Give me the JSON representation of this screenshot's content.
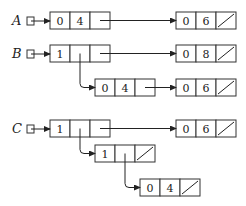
{
  "diagram": {
    "type": "linked-list-structures",
    "variables": [
      {
        "name": "A",
        "y": 21
      },
      {
        "name": "B",
        "y": 54
      },
      {
        "name": "C",
        "y": 129
      }
    ],
    "nodes": [
      {
        "id": "A1",
        "x": 50,
        "y": 12,
        "cells": [
          "0",
          "4",
          ""
        ],
        "nil": false
      },
      {
        "id": "A2",
        "x": 176,
        "y": 12,
        "cells": [
          "0",
          "6",
          ""
        ],
        "nil": true
      },
      {
        "id": "B1",
        "x": 50,
        "y": 45,
        "cells": [
          "1",
          "",
          ""
        ],
        "nil": false
      },
      {
        "id": "B2",
        "x": 176,
        "y": 45,
        "cells": [
          "0",
          "8",
          ""
        ],
        "nil": true
      },
      {
        "id": "B3",
        "x": 95,
        "y": 79,
        "cells": [
          "0",
          "4",
          ""
        ],
        "nil": false
      },
      {
        "id": "B4",
        "x": 176,
        "y": 79,
        "cells": [
          "0",
          "6",
          ""
        ],
        "nil": true
      },
      {
        "id": "C1",
        "x": 50,
        "y": 120,
        "cells": [
          "1",
          "",
          ""
        ],
        "nil": false
      },
      {
        "id": "C2",
        "x": 176,
        "y": 120,
        "cells": [
          "0",
          "6",
          ""
        ],
        "nil": true
      },
      {
        "id": "C3",
        "x": 95,
        "y": 145,
        "cells": [
          "1",
          "",
          ""
        ],
        "nil": true
      },
      {
        "id": "C4",
        "x": 140,
        "y": 179,
        "cells": [
          "0",
          "4",
          ""
        ],
        "nil": true
      }
    ],
    "edges": [
      {
        "from": "A",
        "to": "A1"
      },
      {
        "from": "A1.next",
        "to": "A2"
      },
      {
        "from": "B",
        "to": "B1"
      },
      {
        "from": "B1.next",
        "to": "B2"
      },
      {
        "from": "B1.down",
        "to": "B3"
      },
      {
        "from": "B3.next",
        "to": "B4"
      },
      {
        "from": "C",
        "to": "C1"
      },
      {
        "from": "C1.next",
        "to": "C2"
      },
      {
        "from": "C1.down",
        "to": "C3"
      },
      {
        "from": "C3.down",
        "to": "C4"
      }
    ]
  }
}
